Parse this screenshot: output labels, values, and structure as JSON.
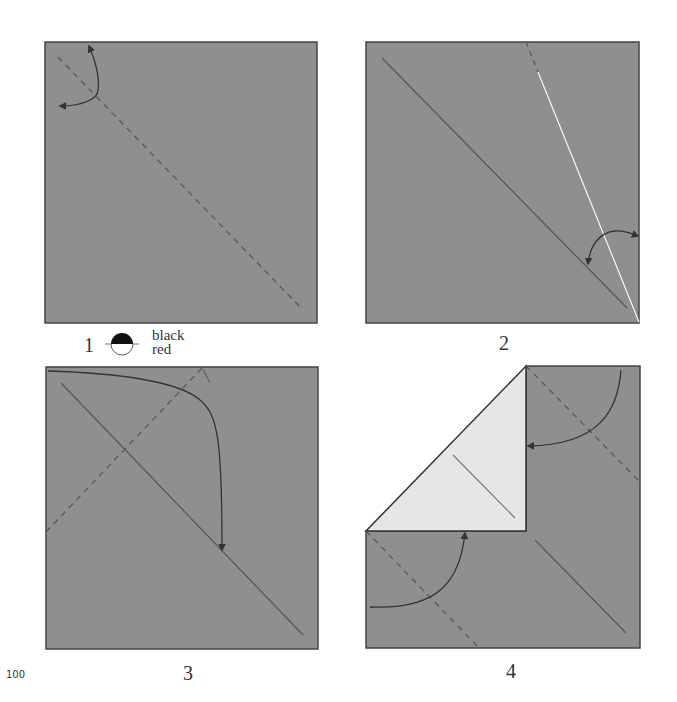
{
  "steps": [
    {
      "number": "1"
    },
    {
      "number": "2"
    },
    {
      "number": "3"
    },
    {
      "number": "4"
    }
  ],
  "legend": {
    "top_label": "black",
    "bottom_label": "red"
  },
  "page_number": "100",
  "colors": {
    "paper_black": "#8f8f8f",
    "paper_red": "#e6e6e6",
    "line": "#444444",
    "crease_valley": "#555555",
    "crease_white": "#ffffff"
  }
}
